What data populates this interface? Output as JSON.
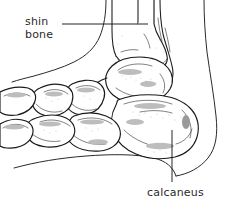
{
  "figure": {
    "name": "foot-ankle-lateral-diagram",
    "background_color": "#ffffff",
    "line_color": "#1a1a1a",
    "text_color": "#2b2b2b",
    "width": 231,
    "height": 206
  },
  "labels": {
    "shin_bone_line1": "shin",
    "shin_bone_line2": "bone",
    "calcaneus": "calcaneus"
  },
  "annotations": {
    "shin_bone_leader": {
      "x1": 62,
      "y1": 24,
      "x2": 148,
      "y2": 24
    },
    "calcaneus_leader": {
      "x1": 172,
      "y1": 130,
      "x2": 172,
      "y2": 182
    }
  },
  "text_positions": {
    "shin_x": 25,
    "shin_y": 25,
    "bone_x": 25,
    "bone_y": 38,
    "calcaneus_x": 147,
    "calcaneus_y": 196
  }
}
